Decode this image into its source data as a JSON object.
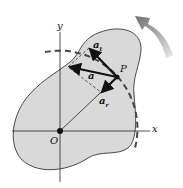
{
  "diagram": {
    "labels": {
      "y_axis": "y",
      "x_axis": "x",
      "origin": "O",
      "point": "P",
      "accel": "a",
      "tangential": "a",
      "tangential_sub": "t",
      "normal": "a",
      "normal_sub": "r"
    },
    "colors": {
      "body_fill": "#d9d9d9",
      "ink": "#111111",
      "rotation_arrow": "#808080"
    }
  }
}
